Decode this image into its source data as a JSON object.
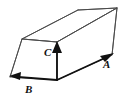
{
  "figure": {
    "kind": "vector-diagram",
    "background_color": "#ffffff",
    "line_color": "#3a3a3a",
    "arrow_color": "#111111",
    "label_color": "#111111",
    "labels": {
      "a": "A",
      "b": "B",
      "c": "C"
    },
    "vectors": [
      {
        "name": "A",
        "label": "A",
        "edge": "bottom-right",
        "direction": "up-right",
        "from": [
          57,
          80
        ],
        "to": [
          112,
          55
        ]
      },
      {
        "name": "B",
        "label": "B",
        "edge": "bottom-left",
        "direction": "left",
        "from": [
          57,
          80
        ],
        "to": [
          11,
          76
        ]
      },
      {
        "name": "C",
        "label": "C",
        "edge": "front-vertical",
        "direction": "up",
        "from": [
          57,
          80
        ],
        "to": [
          57,
          42
        ]
      }
    ],
    "box": {
      "top_face": [
        [
          22,
          39
        ],
        [
          78,
          10
        ],
        [
          117,
          8
        ],
        [
          57,
          42
        ]
      ],
      "front_left_face": [
        [
          22,
          39
        ],
        [
          57,
          42
        ],
        [
          57,
          80
        ],
        [
          10,
          77
        ]
      ],
      "front_right_face": [
        [
          57,
          42
        ],
        [
          117,
          8
        ],
        [
          112,
          55
        ],
        [
          57,
          80
        ]
      ],
      "vertical_edges": [
        [
          [
            22,
            39
          ],
          [
            10,
            77
          ]
        ],
        [
          [
            57,
            42
          ],
          [
            57,
            80
          ]
        ],
        [
          [
            117,
            8
          ],
          [
            112,
            55
          ]
        ]
      ]
    }
  }
}
